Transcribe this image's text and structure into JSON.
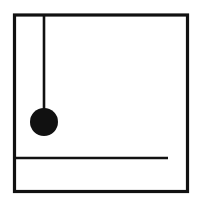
{
  "canvas": {
    "width": 202,
    "height": 204,
    "background_color": "#ffffff",
    "ink_color": "#111111"
  },
  "figure": {
    "name": "pendulum-diagram",
    "style": "hand-drawn black ink line art on white"
  },
  "frame": {
    "name": "square-border",
    "left": 14.5,
    "top": 15.0,
    "right": 187.5,
    "bottom": 191.5,
    "stroke_width": 3.2,
    "color": "#111111"
  },
  "string": {
    "name": "pendulum-string",
    "x": 44.0,
    "y_top": 15.0,
    "y_bottom": 110.0,
    "stroke_width": 2.6,
    "color": "#111111"
  },
  "bob": {
    "name": "pendulum-bob",
    "center_x": 44.0,
    "center_y": 122.0,
    "radius": 14.0,
    "fill": "#111111"
  },
  "baseline": {
    "name": "horizontal-rule",
    "x_start": 16.0,
    "x_end": 168.0,
    "y": 158.0,
    "stroke_width": 2.4,
    "color": "#111111"
  }
}
